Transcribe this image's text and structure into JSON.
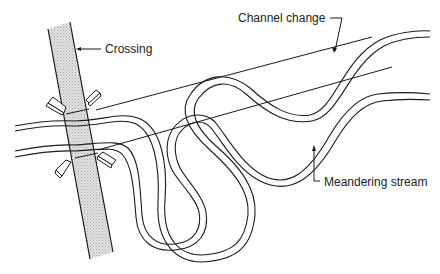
{
  "diagram": {
    "type": "engineering line drawing",
    "colors": {
      "ink": "#1a1a1a",
      "road_fill": "#d4d4d4",
      "background": "#ffffff"
    },
    "labels": {
      "crossing": "Crossing",
      "channel_change": "Channel change",
      "meandering_stream": "Meandering stream"
    },
    "elements": [
      {
        "id": "road-crossing",
        "description": "Diagonal hatched roadway band crossing the stream"
      },
      {
        "id": "wingwalls",
        "description": "Four angled abutment wing walls at the crossing"
      },
      {
        "id": "original-stream",
        "description": "Double-banked meandering stream forming a deep loop"
      },
      {
        "id": "shifted-stream",
        "description": "Inner double-banked stream path showing channel migration"
      },
      {
        "id": "channel-change-lines",
        "description": "Two straight reference lines from crossing to upstream reach"
      }
    ]
  }
}
